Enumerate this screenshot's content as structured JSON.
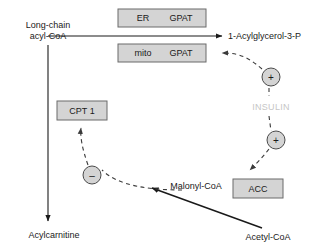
{
  "diagram": {
    "canvas": {
      "width": 318,
      "height": 252,
      "background": "#ffffff"
    },
    "colors": {
      "box_fill": "#d4d4d4",
      "box_stroke": "#6b6b6b",
      "text": "#1a1a1a",
      "insulin_text": "#c6c6c6",
      "arrow": "#1a1a1a",
      "dashed_arrow": "#3b3b3b",
      "circle_fill": "#d4d4d4",
      "circle_stroke": "#4a4a4a"
    },
    "metabolites": [
      {
        "id": "long-chain-acyl-coa",
        "line1": "Long-chain",
        "line2": "acyl-CoA",
        "x": 48,
        "y": 28
      },
      {
        "id": "acylglycerol-3-p",
        "label": "1-Acylglycerol-3-P",
        "x": 228,
        "y": 36
      },
      {
        "id": "acylcarnitine",
        "label": "Acylcarnitine",
        "x": 54,
        "y": 235
      },
      {
        "id": "malonyl-coa",
        "label": "Malonyl-CoA",
        "x": 196,
        "y": 186
      },
      {
        "id": "acetyl-coa",
        "label": "Acetyl-CoA",
        "x": 268,
        "y": 237
      }
    ],
    "enzyme_boxes": [
      {
        "id": "er-gpat",
        "compartment": "ER",
        "enzyme": "GPAT",
        "x": 118,
        "y": 9,
        "width": 88,
        "height": 18
      },
      {
        "id": "mito-gpat",
        "compartment": "mito",
        "enzyme": "GPAT",
        "x": 118,
        "y": 44,
        "width": 88,
        "height": 18
      },
      {
        "id": "cpt1",
        "compartment": "",
        "enzyme": "CPT 1",
        "x": 57,
        "y": 101,
        "width": 50,
        "height": 19
      },
      {
        "id": "acc",
        "compartment": "",
        "enzyme": "ACC",
        "x": 233,
        "y": 179,
        "width": 50,
        "height": 19
      }
    ],
    "hormones": [
      {
        "id": "insulin",
        "label": "INSULIN",
        "x": 251,
        "y": 107
      }
    ],
    "regulation_nodes": [
      {
        "id": "insulin-activates-gpat",
        "sign": "+",
        "cx": 271,
        "cy": 77,
        "r": 9
      },
      {
        "id": "insulin-activates-acc",
        "sign": "+",
        "cx": 276,
        "cy": 140,
        "r": 9
      },
      {
        "id": "malonyl-inhibits-cpt1",
        "sign": "–",
        "cx": 92,
        "cy": 175,
        "r": 9
      }
    ],
    "edges": [
      {
        "id": "acyl-coa-to-acylglycerol",
        "style": "solid",
        "from": "long-chain-acyl-CoA",
        "to": "1-Acylglycerol-3-P"
      },
      {
        "id": "acyl-coa-to-acylcarnitine",
        "style": "solid",
        "from": "long-chain-acyl-CoA",
        "to": "Acylcarnitine"
      },
      {
        "id": "acetyl-coa-to-malonyl-coa",
        "style": "solid",
        "from": "Acetyl-CoA",
        "to": "Malonyl-CoA"
      },
      {
        "id": "insulin-to-mito-gpat",
        "style": "dashed",
        "from": "INSULIN +",
        "to": "mito GPAT"
      },
      {
        "id": "insulin-to-acc",
        "style": "dashed",
        "from": "INSULIN +",
        "to": "ACC"
      },
      {
        "id": "malonyl-coa-to-cpt1",
        "style": "dashed",
        "from": "Malonyl-CoA",
        "to": "CPT 1"
      }
    ]
  }
}
